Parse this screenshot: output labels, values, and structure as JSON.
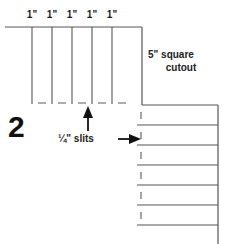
{
  "figure": {
    "step_number": "2",
    "top_dimensions": [
      "1\"",
      "1\"",
      "1\"",
      "1\"",
      "1\""
    ],
    "cutout_label_line1": "5\" square",
    "cutout_label_line2": "cutout",
    "slits_label": "¼\" slits",
    "colors": {
      "line": "#555555",
      "text": "#222222",
      "background": "#ffffff",
      "arrow": "#111111"
    },
    "geometry": {
      "top_edge_y": 27,
      "top_edge_x_start": 5,
      "top_edge_x_end": 142,
      "slit_lines_x": [
        32,
        52,
        72,
        92,
        112
      ],
      "slit_lines_y_end": 104,
      "slit_end_dashes_x": [
        42,
        62,
        82,
        102,
        122
      ],
      "right_edge_x": 142,
      "right_panel_lines_y": [
        105,
        125,
        145,
        165,
        185,
        205,
        225
      ],
      "right_panel_x_end": 218,
      "right_panel_vertical_x": 218,
      "right_panel_vertical_y_end": 244,
      "dash_marks_x": 141,
      "up_arrow_x": 88,
      "up_arrow_y_tip": 108,
      "up_arrow_y_tail": 131,
      "right_arrow_y": 139,
      "right_arrow_x_tip": 142,
      "right_arrow_x_tail": 118
    }
  }
}
